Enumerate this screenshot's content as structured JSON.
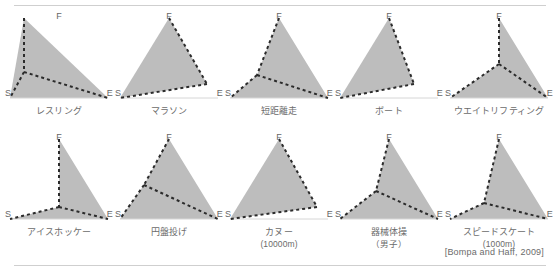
{
  "figure": {
    "source_citation": "[Bompa and Haff, 2009]",
    "vertex_labels": {
      "top": "F",
      "left": "S",
      "right": "E"
    },
    "colors": {
      "fill": "#bdbdbd",
      "dash": "#2b2b2b",
      "text": "#6b6b6b",
      "rule": "#cfcfcf",
      "background": "#ffffff"
    }
  },
  "chart_data": {
    "type": "radar",
    "title": "",
    "axes": [
      "F",
      "S",
      "E"
    ],
    "axis_names": {
      "F": "F",
      "S": "S",
      "E": "E"
    },
    "axis_max": 1.0,
    "grid": false,
    "legend": "none",
    "note": "Each panel is a triangular (3-axis) profile. Values are the fraction of each axis length reached by the shaded/dashed polygon vertex, read off the panel.",
    "series": [
      {
        "name": "レスリング",
        "sub": "",
        "values": {
          "F": 0.52,
          "S": 1.0,
          "E": 1.0
        }
      },
      {
        "name": "マラソン",
        "sub": "",
        "values": {
          "F": 1.0,
          "S": 1.0,
          "E": 0.3
        }
      },
      {
        "name": "短距離走",
        "sub": "",
        "values": {
          "F": 1.0,
          "S": 0.62,
          "E": 1.0
        }
      },
      {
        "name": "ボート",
        "sub": "",
        "values": {
          "F": 1.0,
          "S": 1.0,
          "E": 0.55
        }
      },
      {
        "name": "ウエイトリフティング",
        "sub": "",
        "values": {
          "F": 0.6,
          "S": 1.0,
          "E": 1.0
        }
      },
      {
        "name": "アイスホッケー",
        "sub": "",
        "values": {
          "F": 0.88,
          "S": 1.0,
          "E": 1.0
        }
      },
      {
        "name": "円盤投げ",
        "sub": "",
        "values": {
          "F": 1.0,
          "S": 0.45,
          "E": 1.0
        }
      },
      {
        "name": "カヌー",
        "sub": "(10000m)",
        "values": {
          "F": 1.0,
          "S": 1.0,
          "E": 0.35
        }
      },
      {
        "name": "器械体操",
        "sub": "（男子）",
        "values": {
          "F": 1.0,
          "S": 0.75,
          "E": 1.0
        }
      },
      {
        "name": "スピードスケート",
        "sub": "(1000m)",
        "values": {
          "F": 0.78,
          "S": 1.0,
          "E": 1.0
        }
      }
    ]
  },
  "panels": [
    {
      "label": "レスリング",
      "sub": "",
      "fill": "20,6 104,86 6,86",
      "dash": [
        [
          "20,6",
          "20,60"
        ],
        [
          "20,60",
          "6,86"
        ],
        [
          "20,60",
          "104,86"
        ]
      ]
    },
    {
      "label": "マラソン",
      "sub": "",
      "fill": "55,6 93,72 6,86",
      "dash": [
        [
          "55,6",
          "93,72"
        ],
        [
          "93,72",
          "6,86"
        ]
      ]
    },
    {
      "label": "短距離走",
      "sub": "",
      "fill": "55,6 104,86 6,86 33,63",
      "dash": [
        [
          "55,6",
          "33,63"
        ],
        [
          "33,63",
          "6,86"
        ],
        [
          "33,63",
          "104,86"
        ]
      ]
    },
    {
      "label": "ボート",
      "sub": "",
      "fill": "55,6 80,72 6,86",
      "dash": [
        [
          "55,6",
          "80,72"
        ],
        [
          "80,72",
          "6,86"
        ]
      ]
    },
    {
      "label": "ウエイトリフティング",
      "sub": "",
      "fill": "55,6 104,86 6,86 55,52",
      "dash": [
        [
          "55,6",
          "55,52"
        ],
        [
          "55,52",
          "6,86"
        ],
        [
          "55,52",
          "104,86"
        ]
      ]
    },
    {
      "label": "アイスホッケー",
      "sub": "",
      "fill": "55,6 104,86 6,86 55,74",
      "dash": [
        [
          "55,6",
          "55,74"
        ],
        [
          "55,74",
          "6,86"
        ],
        [
          "55,74",
          "104,86"
        ]
      ]
    },
    {
      "label": "円盤投げ",
      "sub": "",
      "fill": "55,6 104,86 6,86 30,52",
      "dash": [
        [
          "55,6",
          "30,52"
        ],
        [
          "30,52",
          "6,86"
        ],
        [
          "30,52",
          "104,86"
        ]
      ]
    },
    {
      "label": "カヌー",
      "sub": "(10000m)",
      "fill": "55,6 93,74 6,86",
      "dash": [
        [
          "55,6",
          "93,74"
        ],
        [
          "93,74",
          "6,86"
        ]
      ]
    },
    {
      "label": "器械体操",
      "sub": "（男子）",
      "fill": "55,6 104,86 6,86 42,58",
      "dash": [
        [
          "55,6",
          "42,58"
        ],
        [
          "42,58",
          "6,86"
        ],
        [
          "42,58",
          "104,86"
        ]
      ]
    },
    {
      "label": "スピードスケート",
      "sub": "(1000m)",
      "fill": "55,6 104,86 6,86 40,70",
      "dash": [
        [
          "55,6",
          "40,70"
        ],
        [
          "40,70",
          "6,86"
        ],
        [
          "40,70",
          "104,86"
        ]
      ]
    }
  ]
}
